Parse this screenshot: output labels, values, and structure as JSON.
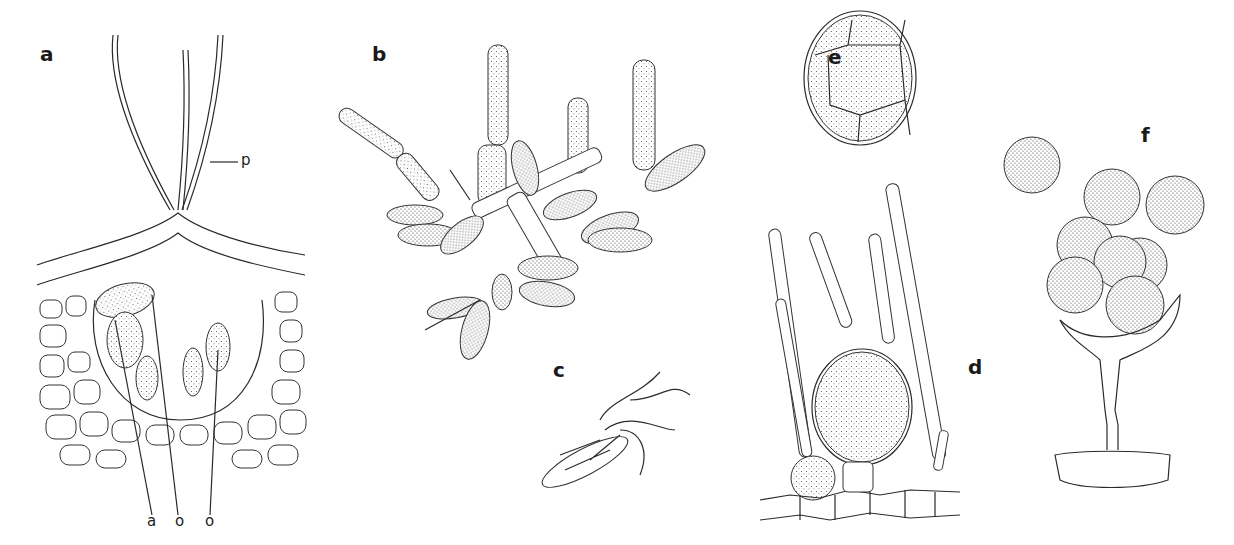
{
  "figure": {
    "panels": [
      {
        "id": "a",
        "label": "a",
        "annotations": [
          "p",
          "a",
          "o",
          "o"
        ]
      },
      {
        "id": "b",
        "label": "b"
      },
      {
        "id": "c",
        "label": "c"
      },
      {
        "id": "d",
        "label": "d"
      },
      {
        "id": "e",
        "label": "e"
      },
      {
        "id": "f",
        "label": "f"
      }
    ],
    "annotation_labels": {
      "p": "p",
      "a": "a",
      "o1": "o",
      "o2": "o"
    }
  }
}
